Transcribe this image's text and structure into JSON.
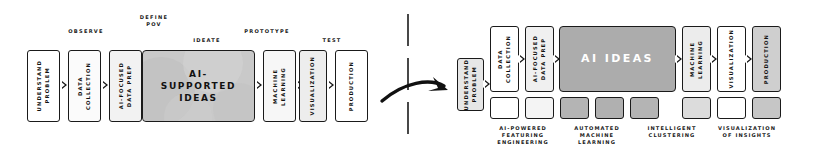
{
  "diagram": {
    "title_left": "Design thinking with AI-supported ideas",
    "title_right": "AI ideas pipeline",
    "colors": {
      "outline": "#1a1a1a",
      "white": "#ffffff",
      "light_gray": "#f0f0f0",
      "mid_gray": "#d8d8d8",
      "dark_gray": "#a8a8a8",
      "text": "#111111"
    }
  },
  "left": {
    "stages": [
      {
        "label": "OBSERVE"
      },
      {
        "label": "DEFINE\nPOV"
      },
      {
        "label": "IDEATE"
      },
      {
        "label": "PROTOTYPE"
      },
      {
        "label": "TEST"
      }
    ],
    "steps": [
      {
        "label": "UNDERSTAND\nPROBLEM",
        "fill": "#ffffff"
      },
      {
        "label": "DATA\nCOLLECTION",
        "fill": "#fbfbfb"
      },
      {
        "label": "AI-FOCUSED\nDATA PREP",
        "fill": "#f2f2f2"
      },
      {
        "label": "MACHINE\nLEARNING",
        "fill": "#f7f7f7"
      },
      {
        "label": "VISUALIZATION",
        "fill": "#ededed"
      },
      {
        "label": "PRODUCTION",
        "fill": "#ffffff"
      }
    ],
    "center": {
      "label": "AI-\nSUPPORTED\nIDEAS",
      "fill": "#c9c9c9"
    }
  },
  "right": {
    "steps": [
      {
        "label": "UNDERSTAND\nPROBLEM",
        "fill": "#e6e6e6"
      },
      {
        "label": "DATA\nCOLLECTION",
        "fill": "#ffffff"
      },
      {
        "label": "AI-FOCUSED\nDATA PREP",
        "fill": "#f0f0f0"
      },
      {
        "label": "MACHINE\nLEARNING",
        "fill": "#ececec"
      },
      {
        "label": "VISUALIZATION",
        "fill": "#ffffff"
      },
      {
        "label": "PRODUCTION",
        "fill": "#cfcfcf"
      }
    ],
    "center": {
      "label": "AI IDEAS",
      "fill": "#acacac",
      "text_color": "#ffffff"
    },
    "swatches": [
      {
        "fill": "#ffffff"
      },
      {
        "fill": "#f4f4f4"
      },
      {
        "fill": "#b4b4b4"
      },
      {
        "fill": "#b0b0b0"
      },
      {
        "fill": "#b4b4b4"
      },
      {
        "fill": "#dcdcdc"
      },
      {
        "fill": "#ffffff"
      },
      {
        "fill": "#c6c6c6"
      }
    ],
    "captions": [
      {
        "label": "AI-POWERED\nFEATURING\nENGINEERING"
      },
      {
        "label": "AUTOMATED\nMACHINE\nLEARNING"
      },
      {
        "label": "INTELLIGENT\nCLUSTERING"
      },
      {
        "label": "VISUALIZATION\nOF INSIGHTS"
      }
    ]
  }
}
